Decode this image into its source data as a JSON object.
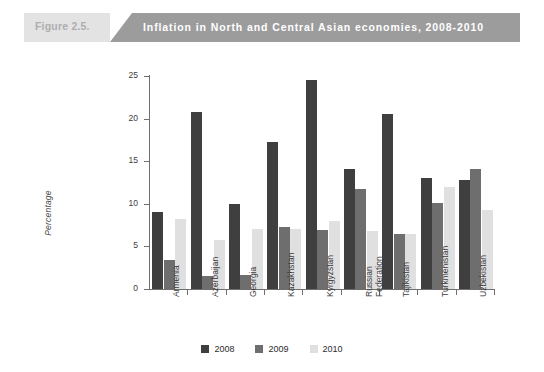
{
  "header": {
    "figure_number": "Figure 2.5.",
    "title": "Inflation in North and Central Asian economies, 2008-2010",
    "figure_box_color": "#e3e3e3",
    "title_wedge_color": "#9c9c9c",
    "title_text_color": "#ffffff",
    "figure_number_color": "#aeaeae"
  },
  "chart_data": {
    "type": "bar",
    "title": "Inflation in North and Central Asian economies, 2008-2010",
    "xlabel": "",
    "ylabel": "Percentage",
    "ylim": [
      0,
      25
    ],
    "yticks": [
      0,
      5,
      10,
      15,
      20,
      25
    ],
    "grid": false,
    "legend_position": "bottom-center",
    "categories": [
      "Armenia",
      "Azerbaijan",
      "Georgia",
      "Kazakhstan",
      "Kyrgyzstan",
      "Russian Federation",
      "Tajikistan",
      "Turkmenistan",
      "Uzbekistan"
    ],
    "series": [
      {
        "name": "2008",
        "color": "#3f3f3f",
        "values": [
          9.0,
          20.8,
          10.0,
          17.2,
          24.5,
          14.1,
          20.5,
          13.0,
          12.8
        ]
      },
      {
        "name": "2009",
        "color": "#6e6e6e",
        "values": [
          3.4,
          1.5,
          1.7,
          7.3,
          6.9,
          11.7,
          6.5,
          10.1,
          14.1
        ]
      },
      {
        "name": "2010",
        "color": "#e0e0e0",
        "values": [
          8.2,
          5.7,
          7.0,
          7.1,
          8.0,
          6.8,
          6.5,
          12.0,
          9.3
        ]
      }
    ]
  },
  "axis": {
    "line_color": "#6f6f6f"
  }
}
